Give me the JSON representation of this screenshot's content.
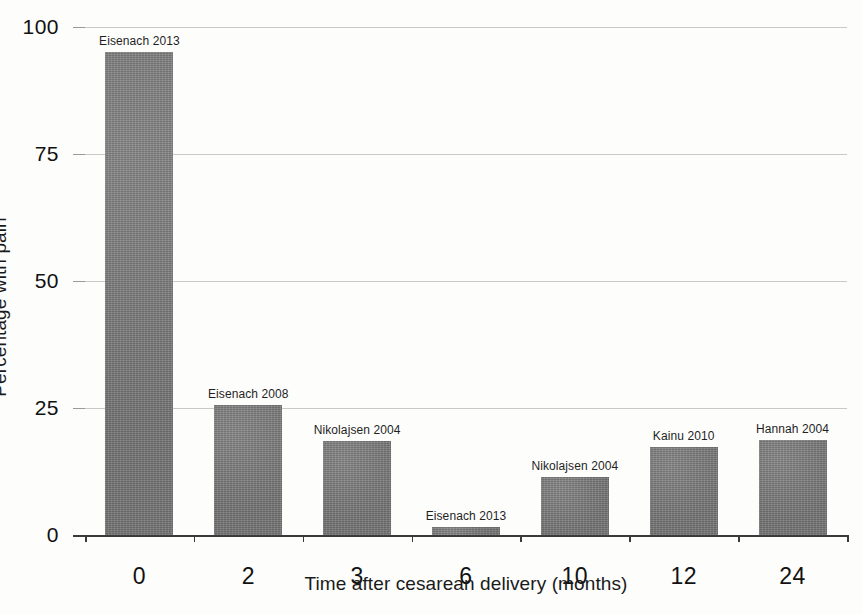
{
  "chart_data": {
    "type": "bar",
    "title": "",
    "xlabel": "Time after cesarean delivery (months)",
    "ylabel": "Percentage with pain",
    "categories": [
      "0",
      "2",
      "3",
      "6",
      "10",
      "12",
      "24"
    ],
    "values": [
      95,
      25.5,
      18.5,
      1.6,
      11.5,
      17.3,
      18.7
    ],
    "point_labels": [
      "Eisenach 2013",
      "Eisenach 2008",
      "Nikolajsen 2004",
      "Eisenach 2013",
      "Nikolajsen 2004",
      "Kainu 2010",
      "Hannah 2004"
    ],
    "ylim": [
      0,
      100
    ],
    "yticks": [
      0,
      25,
      50,
      75,
      100
    ],
    "ytick_labels": [
      "0",
      "25",
      "50",
      "75",
      "100"
    ],
    "grid": true,
    "legend": "none",
    "bar_color": "#767676",
    "gridline_color": "#c9c9c7",
    "axis_color": "#3a3a3a",
    "background_color": "#fdfdfc"
  }
}
